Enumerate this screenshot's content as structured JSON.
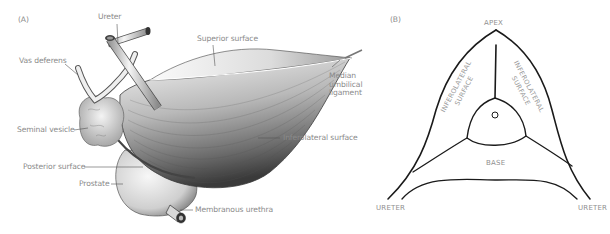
{
  "panel_a": {
    "tag": "(A)",
    "labels": {
      "ureter": "Ureter",
      "superior_surface": "Superior surface",
      "vas_deferens": "Vas deferens",
      "median_umbilical_ligament_1": "Median",
      "median_umbilical_ligament_2": "umbilical",
      "median_umbilical_ligament_3": "ligament",
      "seminal_vesicle": "Seminal vesicle",
      "inferolateral_surface": "Inferolateral surface",
      "posterior_surface": "Posterior surface",
      "prostate": "Prostate",
      "membranous_urethra": "Membranous urethra"
    }
  },
  "panel_b": {
    "tag": "(B)",
    "labels": {
      "apex": "APEX",
      "inferolateral_left_1": "INFEROLATERAL",
      "inferolateral_left_2": "SURFACE",
      "inferolateral_right_1": "INFEROLATERAL",
      "inferolateral_right_2": "SURFACE",
      "base": "BASE",
      "ureter_left": "URETER",
      "ureter_right": "URETER"
    }
  },
  "colors": {
    "label_text": "#8a8a8a",
    "outline": "#1a1a1a",
    "shading_dark": "#4a4a4a",
    "shading_light": "#e6e6e6"
  }
}
